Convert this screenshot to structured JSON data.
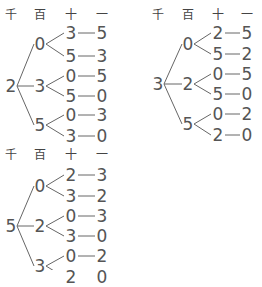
{
  "headers": [
    "千",
    "百",
    "十",
    "一"
  ],
  "trees": [
    {
      "id": "tree-2",
      "thousands": "2",
      "origin": {
        "x": 11,
        "y": 86
      },
      "header_y": 15,
      "cols": [
        11,
        40,
        71,
        102
      ],
      "hundreds": [
        {
          "digit": "0",
          "y": 44,
          "tens": [
            {
              "digit": "3",
              "y": 33,
              "unit": "5"
            },
            {
              "digit": "5",
              "y": 56,
              "unit": "3"
            }
          ]
        },
        {
          "digit": "3",
          "y": 86,
          "tens": [
            {
              "digit": "0",
              "y": 76,
              "unit": "5"
            },
            {
              "digit": "5",
              "y": 96,
              "unit": "0"
            }
          ]
        },
        {
          "digit": "5",
          "y": 125,
          "tens": [
            {
              "digit": "0",
              "y": 115,
              "unit": "3"
            },
            {
              "digit": "3",
              "y": 136,
              "unit": "0"
            }
          ]
        }
      ]
    },
    {
      "id": "tree-3",
      "thousands": "3",
      "origin": {
        "x": 158,
        "y": 84
      },
      "header_y": 15,
      "cols": [
        158,
        188,
        218,
        247
      ],
      "hundreds": [
        {
          "digit": "0",
          "y": 44,
          "tens": [
            {
              "digit": "2",
              "y": 33,
              "unit": "5"
            },
            {
              "digit": "5",
              "y": 54,
              "unit": "2"
            }
          ]
        },
        {
          "digit": "2",
          "y": 84,
          "tens": [
            {
              "digit": "0",
              "y": 74,
              "unit": "5"
            },
            {
              "digit": "5",
              "y": 94,
              "unit": "0"
            }
          ]
        },
        {
          "digit": "5",
          "y": 124,
          "tens": [
            {
              "digit": "0",
              "y": 114,
              "unit": "2"
            },
            {
              "digit": "2",
              "y": 135,
              "unit": "0"
            }
          ]
        }
      ]
    },
    {
      "id": "tree-5",
      "thousands": "5",
      "origin": {
        "x": 11,
        "y": 226
      },
      "header_y": 155,
      "cols": [
        11,
        40,
        71,
        102
      ],
      "hundreds": [
        {
          "digit": "0",
          "y": 186,
          "tens": [
            {
              "digit": "2",
              "y": 175,
              "unit": "3"
            },
            {
              "digit": "3",
              "y": 196,
              "unit": "2"
            }
          ]
        },
        {
          "digit": "2",
          "y": 226,
          "tens": [
            {
              "digit": "0",
              "y": 216,
              "unit": "3"
            },
            {
              "digit": "3",
              "y": 236,
              "unit": "0"
            }
          ]
        },
        {
          "digit": "3",
          "y": 266,
          "tens": [
            {
              "digit": "0",
              "y": 256,
              "unit": "2"
            },
            {
              "digit": "2",
              "y": 277,
              "unit": "0"
            }
          ]
        }
      ]
    }
  ]
}
